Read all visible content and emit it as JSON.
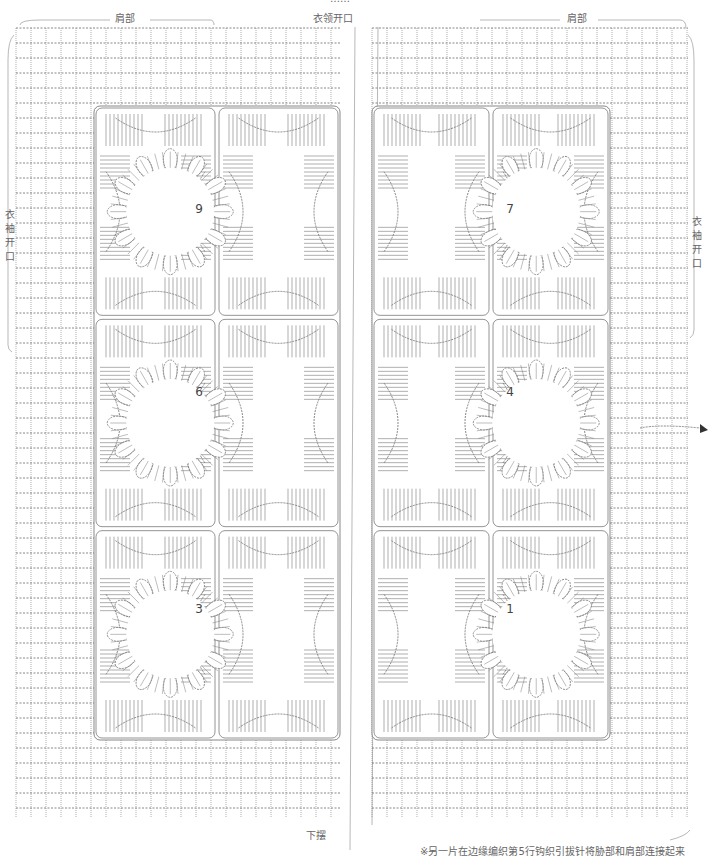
{
  "diagram": {
    "type": "crochet-chart",
    "colors": {
      "stitch": "#7a7a7a",
      "bracket": "#9a9a9a",
      "text": "#666666",
      "background": "#ffffff"
    },
    "top_partial_text": "……",
    "labels": {
      "left_shoulder": "肩部",
      "right_shoulder": "肩部",
      "neck_opening": "衣领开口",
      "left_sleeve_opening": "衣袖开口",
      "right_sleeve_opening": "衣袖开口",
      "hem": "下摆",
      "footnote": "※另一片在边缘编织第5行钩织引拔针将胁部和肩部连接起来"
    },
    "panels": [
      {
        "name": "left-panel",
        "x": 16,
        "y": 28,
        "w": 324,
        "h": 790
      },
      {
        "name": "right-panel",
        "x": 372,
        "y": 28,
        "w": 316,
        "h": 790
      }
    ],
    "motifs": [
      {
        "number": "9",
        "panel": "left",
        "row": 0
      },
      {
        "number": "6",
        "panel": "left",
        "row": 1
      },
      {
        "number": "3",
        "panel": "left",
        "row": 2
      },
      {
        "number": "7",
        "panel": "right",
        "row": 0
      },
      {
        "number": "4",
        "panel": "right",
        "row": 1
      },
      {
        "number": "1",
        "panel": "right",
        "row": 2
      }
    ],
    "join_marker": "arrow-right-icon"
  }
}
